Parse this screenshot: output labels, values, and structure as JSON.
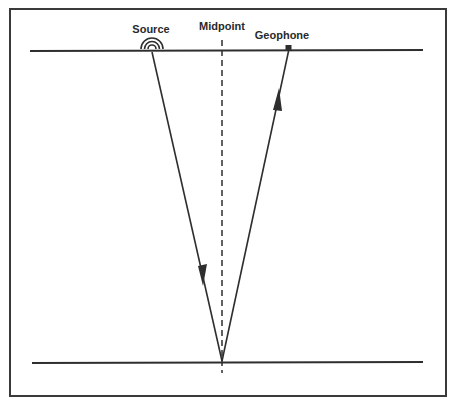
{
  "diagram": {
    "type": "seismic-reflection-ray-path",
    "labels": {
      "source": "Source",
      "midpoint": "Midpoint",
      "geophone": "Geophone"
    },
    "elements": {
      "surface_line": {
        "x1": 30,
        "y1": 51,
        "x2": 423,
        "y2": 50
      },
      "reflector_line": {
        "x1": 32,
        "y1": 363,
        "x2": 423,
        "y2": 362
      },
      "midpoint_line": {
        "x": 222,
        "y1": 40,
        "y2": 373,
        "style": "dashed"
      },
      "source_point": {
        "x": 152,
        "y": 51
      },
      "geophone_point": {
        "x": 289,
        "y": 48
      },
      "reflection_point": {
        "x": 222,
        "y": 361
      },
      "incident_ray": {
        "from": "source_point",
        "to": "reflection_point",
        "arrow": "down"
      },
      "reflected_ray": {
        "from": "reflection_point",
        "to": "geophone_point",
        "arrow": "up"
      }
    },
    "colors": {
      "line": "#2e2e2e",
      "background": "#ffffff"
    }
  }
}
